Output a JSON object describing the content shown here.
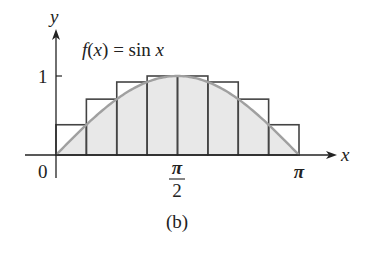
{
  "figure": {
    "caption": "(b)",
    "function_label": "f(x) = sin x",
    "function_label_parts": {
      "f": "f",
      "open": "(",
      "x": "x",
      "close": ")",
      "eq": " = sin ",
      "arg": "x"
    },
    "axes": {
      "x_label": "x",
      "y_label": "y",
      "x_ticks": [
        {
          "value": 0,
          "label": "0"
        },
        {
          "value": 1.5708,
          "label_num": "π",
          "label_den": "2"
        },
        {
          "value": 3.1416,
          "label": "π"
        }
      ],
      "y_ticks": [
        {
          "value": 1,
          "label": "1"
        }
      ]
    },
    "colors": {
      "curve": "#a0a0a0",
      "fill": "#e8e8e8",
      "rect_stroke": "#444444",
      "axis": "#222222"
    }
  },
  "chart_data": {
    "type": "area",
    "title": "f(x) = sin x",
    "caption": "(b)",
    "xlabel": "x",
    "ylabel": "y",
    "xlim": [
      0,
      3.1416
    ],
    "ylim": [
      0,
      1
    ],
    "curve": "sin x",
    "rectangles": {
      "n": 8,
      "kind": "upper sum",
      "intervals": [
        [
          0,
          0.3927
        ],
        [
          0.3927,
          0.7854
        ],
        [
          0.7854,
          1.1781
        ],
        [
          1.1781,
          1.5708
        ],
        [
          1.5708,
          1.9635
        ],
        [
          1.9635,
          2.3562
        ],
        [
          2.3562,
          2.7489
        ],
        [
          2.7489,
          3.1416
        ]
      ],
      "heights": [
        0.383,
        0.707,
        0.924,
        1.0,
        1.0,
        0.924,
        0.707,
        0.383
      ]
    },
    "x_tick_labels": [
      "0",
      "π/2",
      "π"
    ],
    "y_tick_labels": [
      "1"
    ],
    "grid": false
  }
}
